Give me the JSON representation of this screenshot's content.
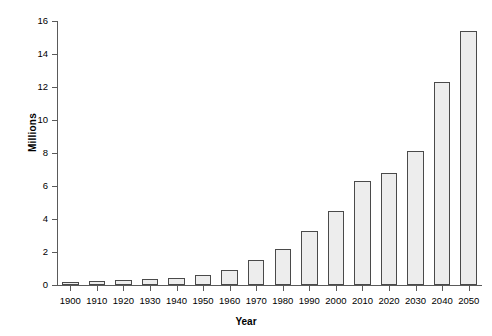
{
  "chart_data": {
    "type": "bar",
    "title": "",
    "xlabel": "Year",
    "ylabel": "Millions",
    "categories": [
      "1900",
      "1910",
      "1920",
      "1930",
      "1940",
      "1950",
      "1960",
      "1970",
      "1980",
      "1990",
      "2000",
      "2010",
      "2020",
      "2030",
      "2040",
      "2050"
    ],
    "values": [
      0.2,
      0.25,
      0.3,
      0.35,
      0.45,
      0.6,
      0.9,
      1.5,
      2.2,
      3.3,
      4.5,
      6.3,
      6.8,
      8.1,
      12.3,
      15.4
    ],
    "ylim": [
      0,
      16
    ],
    "ytick_labels": [
      "0",
      "2",
      "4",
      "6",
      "8",
      "10",
      "12",
      "14",
      "16"
    ],
    "ytick_values": [
      0,
      2,
      4,
      6,
      8,
      10,
      12,
      14,
      16
    ],
    "grid": false,
    "legend": false,
    "bar_fill_color": "#ededed",
    "bar_border_color": "#4a4a4a",
    "axis_color": "#5a5a5a",
    "background_color": "#ffffff"
  }
}
